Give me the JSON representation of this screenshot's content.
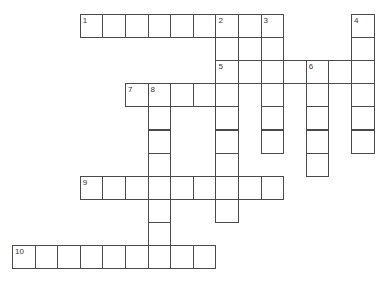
{
  "puzzle": {
    "type": "crossword",
    "cell_width": 22.6,
    "cell_height": 23.1,
    "origin_x": 12,
    "origin_y": 14,
    "line_color": "#4a4a4a",
    "entries": [
      {
        "number": "1",
        "direction": "across",
        "col": 3,
        "row": 0,
        "length": 9
      },
      {
        "number": "2",
        "direction": "down",
        "col": 9,
        "row": 0,
        "length": 9
      },
      {
        "number": "3",
        "direction": "down",
        "col": 11,
        "row": 0,
        "length": 6
      },
      {
        "number": "4",
        "direction": "down",
        "col": 15,
        "row": 0,
        "length": 6
      },
      {
        "number": "5",
        "direction": "across",
        "col": 9,
        "row": 2,
        "length": 7
      },
      {
        "number": "6",
        "direction": "down",
        "col": 13,
        "row": 2,
        "length": 5
      },
      {
        "number": "7",
        "direction": "across",
        "col": 5,
        "row": 3,
        "length": 5
      },
      {
        "number": "8",
        "direction": "down",
        "col": 6,
        "row": 3,
        "length": 8
      },
      {
        "number": "9",
        "direction": "across",
        "col": 3,
        "row": 7,
        "length": 9
      },
      {
        "number": "10",
        "direction": "across",
        "col": 0,
        "row": 10,
        "length": 9
      }
    ]
  }
}
